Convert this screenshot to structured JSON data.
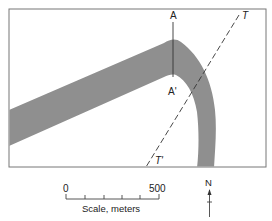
{
  "figure": {
    "type": "geologic-map",
    "colors": {
      "frame": "#777777",
      "band": "#8f8f8f",
      "line": "#333333",
      "text": "#222222",
      "background": "#ffffff"
    }
  },
  "labels": {
    "section_top": "A",
    "section_bottom": "A'",
    "traverse_top": "T",
    "traverse_bottom": "T'"
  },
  "scale_bar": {
    "start_label": "0",
    "end_label": "500",
    "caption": "Scale, meters",
    "ticks": 6
  },
  "north_arrow": {
    "label": "N"
  }
}
